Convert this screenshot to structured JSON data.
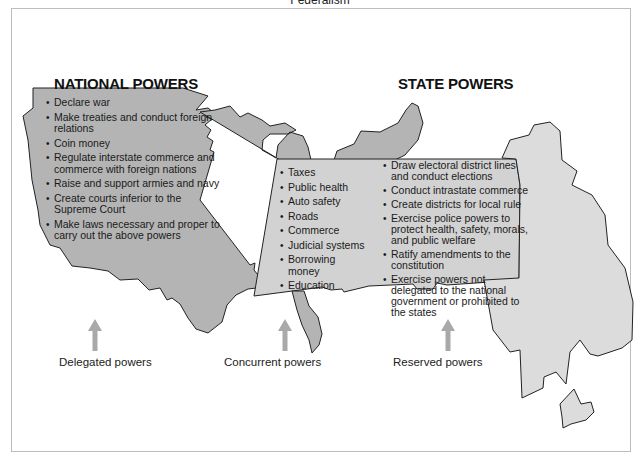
{
  "title": "Federalism",
  "colors": {
    "national_fill": "#b4b4b4",
    "state_fill": "#dcdcdc",
    "concurrent_fill": "#d2d2d2",
    "outline": "#222222",
    "arrow": "#a9a9a9",
    "frame_border": "#bdbdbd"
  },
  "national": {
    "heading": "NATIONAL POWERS",
    "items": [
      "Declare war",
      "Make treaties and conduct foreign relations",
      "Coin money",
      "Regulate interstate commerce and commerce with foreign nations",
      "Raise and support armies and navy",
      "Create courts inferior to the Supreme Court",
      "Make laws necessary and proper to carry out the above powers"
    ]
  },
  "concurrent": {
    "items": [
      "Taxes",
      "Public health",
      "Auto safety",
      "Roads",
      "Commerce",
      "Judicial systems",
      "Borrowing money",
      "Education"
    ]
  },
  "state": {
    "heading": "STATE POWERS",
    "items": [
      "Draw electoral district lines and conduct elections",
      "Conduct intrastate commerce",
      "Create districts for local rule",
      "Exercise police powers to protect health, safety, morals, and public welfare",
      "Ratify amendments to the constitution",
      "Exercise powers not delegated to the national government or prohibited to the states"
    ]
  },
  "labels": {
    "delegated": "Delegated powers",
    "concurrent": "Concurrent powers",
    "reserved": "Reserved powers"
  }
}
